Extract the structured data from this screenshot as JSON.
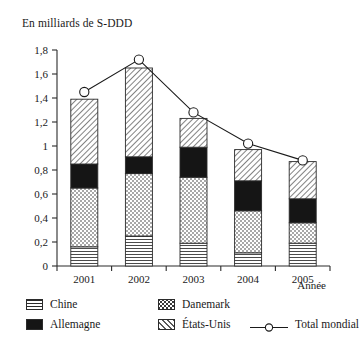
{
  "chart_data": {
    "type": "bar",
    "stacked": true,
    "title": "En milliards de S-DDD",
    "xlabel": "Année",
    "ylabel": "",
    "categories": [
      "2001",
      "2002",
      "2003",
      "2004",
      "2005"
    ],
    "ylim": [
      0,
      1.8
    ],
    "ytick_labels": [
      "0",
      "0,2",
      "0,4",
      "0,6",
      "0,8",
      "1",
      "1,2",
      "1,4",
      "1,6",
      "1,8"
    ],
    "ytick_values": [
      0,
      0.2,
      0.4,
      0.6,
      0.8,
      1.0,
      1.2,
      1.4,
      1.6,
      1.8
    ],
    "grid": false,
    "legend_position": "bottom",
    "series": [
      {
        "name": "Chine",
        "pattern": "horizontal-lines",
        "values": [
          0.16,
          0.25,
          0.19,
          0.11,
          0.19
        ]
      },
      {
        "name": "Danemark",
        "pattern": "dots",
        "values": [
          0.49,
          0.52,
          0.55,
          0.35,
          0.17
        ]
      },
      {
        "name": "Allemagne",
        "pattern": "solid-black",
        "values": [
          0.2,
          0.14,
          0.25,
          0.25,
          0.2
        ]
      },
      {
        "name": "États-Unis",
        "pattern": "diagonal-hatch",
        "values": [
          0.54,
          0.74,
          0.24,
          0.26,
          0.31
        ]
      }
    ],
    "line_series": [
      {
        "name": "Total mondial",
        "marker": "open-circle",
        "values": [
          1.45,
          1.72,
          1.28,
          1.02,
          0.88
        ]
      }
    ],
    "stack_totals": [
      1.39,
      1.65,
      1.23,
      0.97,
      0.87
    ]
  },
  "axis": {
    "y_ticks": [
      {
        "label": "1,8",
        "value": 1.8
      },
      {
        "label": "1,6",
        "value": 1.6
      },
      {
        "label": "1,4",
        "value": 1.4
      },
      {
        "label": "1,2",
        "value": 1.2
      },
      {
        "label": "1",
        "value": 1.0
      },
      {
        "label": "0,8",
        "value": 0.8
      },
      {
        "label": "0,6",
        "value": 0.6
      },
      {
        "label": "0,4",
        "value": 0.4
      },
      {
        "label": "0,2",
        "value": 0.2
      },
      {
        "label": "0",
        "value": 0
      }
    ],
    "x_categories": [
      "2001",
      "2002",
      "2003",
      "2004",
      "2005"
    ],
    "x_axis_name": "Année"
  },
  "legend": {
    "items": [
      {
        "label": "Chine",
        "pattern": "horizontal-lines"
      },
      {
        "label": "Danemark",
        "pattern": "dots"
      },
      {
        "label": "Allemagne",
        "pattern": "solid-black"
      },
      {
        "label": "États-Unis",
        "pattern": "diagonal-hatch"
      },
      {
        "label": "Total mondial",
        "pattern": "line-open-circle"
      }
    ]
  },
  "colors": {
    "ink": "#1a1a1a",
    "axis": "#2b2b2b",
    "background": "#ffffff",
    "black_fill": "#111111"
  }
}
